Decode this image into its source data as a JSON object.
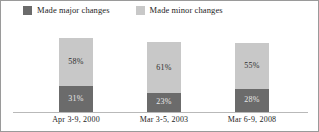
{
  "chart_data": {
    "type": "bar",
    "subtype": "stacked-vertical",
    "title": "",
    "subtitle": "",
    "xlabel": "",
    "ylabel": "",
    "ylim": [
      0,
      100
    ],
    "grid": false,
    "legend_position": "top-left",
    "categories": [
      "Apr 3-9, 2000",
      "Mar 3-5, 2003",
      "Mar 6-9, 2008"
    ],
    "series": [
      {
        "name": "Made major changes",
        "color": "#6b6b6b",
        "values": [
          31,
          23,
          28
        ],
        "labels": [
          "31%",
          "23%",
          "28%"
        ]
      },
      {
        "name": "Made minor changes",
        "color": "#c8c8c8",
        "values": [
          58,
          61,
          55
        ],
        "labels": [
          "58%",
          "61%",
          "55%"
        ]
      }
    ],
    "stack_order": [
      "Made major changes",
      "Made minor changes"
    ]
  },
  "legend": {
    "items": [
      {
        "label": "Made major changes",
        "color": "#6b6b6b"
      },
      {
        "label": "Made minor changes",
        "color": "#c8c8c8"
      }
    ]
  },
  "axis": {
    "ticks": [
      "Apr 3-9, 2000",
      "Mar 3-5, 2003",
      "Mar 6-9, 2008"
    ]
  },
  "bars": [
    {
      "category": "Apr 3-9, 2000",
      "minor_label": "58%",
      "major_label": "31%",
      "minor_value": 58,
      "major_value": 31
    },
    {
      "category": "Mar 3-5, 2003",
      "minor_label": "61%",
      "major_label": "23%",
      "minor_value": 61,
      "major_value": 23
    },
    {
      "category": "Mar 6-9, 2008",
      "minor_label": "55%",
      "major_label": "28%",
      "minor_value": 55,
      "major_value": 28
    }
  ],
  "colors": {
    "major": "#6b6b6b",
    "minor": "#c8c8c8",
    "border": "#9a9a9a",
    "baseline": "#b9b9b9",
    "background": "#ffffff"
  }
}
